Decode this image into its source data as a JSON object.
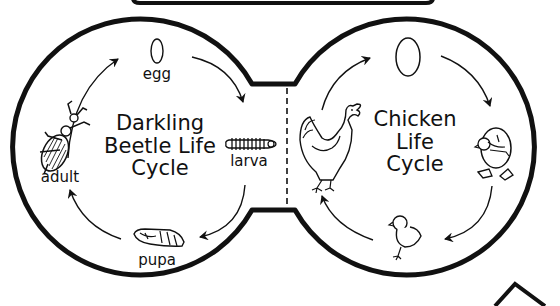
{
  "colors": {
    "ink": "#111111",
    "background": "#ffffff"
  },
  "left_cycle": {
    "title_lines": [
      "Darkling",
      "Beetle Life",
      "Cycle"
    ],
    "stages": [
      {
        "label": "egg",
        "icon": "oval-egg-icon"
      },
      {
        "label": "larva",
        "icon": "mealworm-larva-icon"
      },
      {
        "label": "pupa",
        "icon": "pupa-icon"
      },
      {
        "label": "adult",
        "icon": "beetle-icon"
      }
    ]
  },
  "right_cycle": {
    "title_lines": [
      "Chicken",
      "Life",
      "Cycle"
    ],
    "stages": [
      {
        "label": "",
        "icon": "egg-icon"
      },
      {
        "label": "",
        "icon": "hatching-chick-icon"
      },
      {
        "label": "",
        "icon": "chick-icon"
      },
      {
        "label": "",
        "icon": "hen-icon"
      }
    ]
  }
}
